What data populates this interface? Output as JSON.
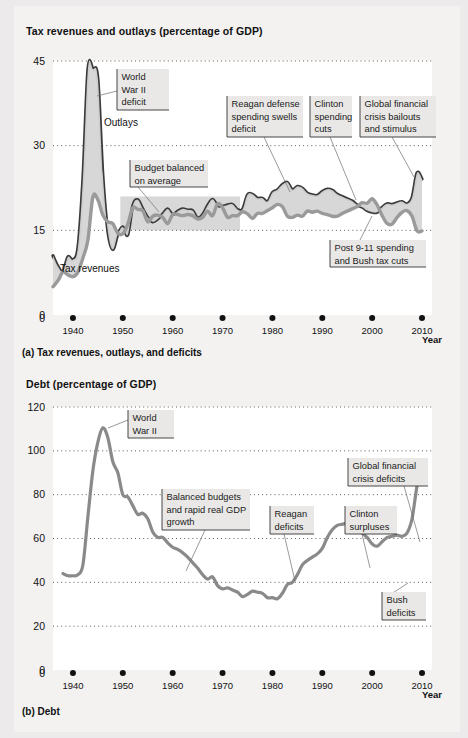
{
  "figure": {
    "background_color": "#eceaea",
    "paper_color": "#f3f2f1",
    "plot_background": "#ffffff"
  },
  "panel_a": {
    "axis_title": "Tax revenues and outlays (percentage of GDP)",
    "caption": "(a) Tax revenues, outlays, and deficits",
    "x_axis_title": "Year"
  },
  "panel_b": {
    "axis_title": "Debt (percentage of GDP)",
    "caption": "(b) Debt",
    "x_axis_title": "Year"
  },
  "chart_data": [
    {
      "type": "area",
      "id": "panel-a",
      "title": "Tax revenues and outlays (percentage of GDP)",
      "subtitle": "(a) Tax revenues, outlays, and deficits",
      "xlabel": "Year",
      "ylabel": "Tax revenues and outlays (percentage of GDP)",
      "xlim": [
        1936,
        2012
      ],
      "ylim": [
        0,
        45
      ],
      "yticks": [
        0,
        15,
        30,
        45
      ],
      "xticks": [
        1940,
        1950,
        1960,
        1970,
        1980,
        1990,
        2000,
        2010
      ],
      "grid": true,
      "legend_position": "inline-labels",
      "series": [
        {
          "name": "Outlays",
          "color": "#3a3a3a",
          "x": [
            1936,
            1937,
            1938,
            1939,
            1940,
            1941,
            1942,
            1943,
            1944,
            1945,
            1946,
            1947,
            1948,
            1949,
            1950,
            1951,
            1952,
            1953,
            1954,
            1955,
            1956,
            1957,
            1958,
            1959,
            1960,
            1961,
            1962,
            1963,
            1964,
            1965,
            1966,
            1967,
            1968,
            1969,
            1970,
            1971,
            1972,
            1973,
            1974,
            1975,
            1976,
            1977,
            1978,
            1979,
            1980,
            1981,
            1982,
            1983,
            1984,
            1985,
            1986,
            1987,
            1988,
            1989,
            1990,
            1991,
            1992,
            1993,
            1994,
            1995,
            1996,
            1997,
            1998,
            1999,
            2000,
            2001,
            2002,
            2003,
            2004,
            2005,
            2006,
            2007,
            2008,
            2009,
            2010
          ],
          "values": [
            10.5,
            8.6,
            7.7,
            10.3,
            9.8,
            12.0,
            24.3,
            43.6,
            43.6,
            41.9,
            24.8,
            14.8,
            11.6,
            14.3,
            15.6,
            14.2,
            19.4,
            20.4,
            18.8,
            17.3,
            16.5,
            17.0,
            17.9,
            18.8,
            17.8,
            18.4,
            18.8,
            18.6,
            18.5,
            17.2,
            17.8,
            19.4,
            20.5,
            19.4,
            19.3,
            19.5,
            19.6,
            18.7,
            18.7,
            21.3,
            21.4,
            20.7,
            20.7,
            20.1,
            21.7,
            22.2,
            23.1,
            23.5,
            22.2,
            22.8,
            22.5,
            21.6,
            21.3,
            21.2,
            21.9,
            22.3,
            22.1,
            21.4,
            21.0,
            20.6,
            20.2,
            19.5,
            19.1,
            18.5,
            18.2,
            18.2,
            19.1,
            19.7,
            19.6,
            19.9,
            20.1,
            19.7,
            20.8,
            25.2,
            24.1
          ]
        },
        {
          "name": "Tax revenues",
          "color": "#9a9a9a",
          "x": [
            1936,
            1937,
            1938,
            1939,
            1940,
            1941,
            1942,
            1943,
            1944,
            1945,
            1946,
            1947,
            1948,
            1949,
            1950,
            1951,
            1952,
            1953,
            1954,
            1955,
            1956,
            1957,
            1958,
            1959,
            1960,
            1961,
            1962,
            1963,
            1964,
            1965,
            1966,
            1967,
            1968,
            1969,
            1970,
            1971,
            1972,
            1973,
            1974,
            1975,
            1976,
            1977,
            1978,
            1979,
            1980,
            1981,
            1982,
            1983,
            1984,
            1985,
            1986,
            1987,
            1988,
            1989,
            1990,
            1991,
            1992,
            1993,
            1994,
            1995,
            1996,
            1997,
            1998,
            1999,
            2000,
            2001,
            2002,
            2003,
            2004,
            2005,
            2006,
            2007,
            2008,
            2009,
            2010
          ],
          "values": [
            5.0,
            6.1,
            7.6,
            7.1,
            6.8,
            7.6,
            10.1,
            13.3,
            20.9,
            20.4,
            17.7,
            16.5,
            16.2,
            14.5,
            14.4,
            16.1,
            19.0,
            18.7,
            18.5,
            16.5,
            17.5,
            17.7,
            17.3,
            16.2,
            17.8,
            17.8,
            17.6,
            17.8,
            17.6,
            17.0,
            17.3,
            18.4,
            17.6,
            19.7,
            19.0,
            17.3,
            17.6,
            17.6,
            18.3,
            17.9,
            17.1,
            18.0,
            18.0,
            18.5,
            19.0,
            19.6,
            19.2,
            17.5,
            17.3,
            17.7,
            17.5,
            18.4,
            18.2,
            18.4,
            18.0,
            17.8,
            17.5,
            17.5,
            18.0,
            18.4,
            18.8,
            19.2,
            19.9,
            19.8,
            20.6,
            19.5,
            17.6,
            16.2,
            16.1,
            17.3,
            18.2,
            18.5,
            17.5,
            14.9,
            14.9
          ]
        }
      ],
      "annotations": [
        {
          "text": [
            "World",
            "War II",
            "deficit"
          ],
          "box": {
            "x": 117,
            "y": 69,
            "w": 52,
            "h": 41
          },
          "leader": [
            [
              117,
              91
            ],
            [
              97,
              96
            ]
          ]
        },
        {
          "text": [
            "Budget balanced",
            "on average"
          ],
          "box": {
            "x": 130,
            "y": 160,
            "w": 78,
            "h": 27
          },
          "leader": [
            [
              138,
              187
            ],
            [
              159,
              212
            ]
          ]
        },
        {
          "text": [
            "Reagan defense",
            "spending swells",
            "deficit"
          ],
          "box": {
            "x": 227,
            "y": 96,
            "w": 76,
            "h": 41
          },
          "leader": [
            [
              264,
              137
            ],
            [
              290,
              192
            ]
          ]
        },
        {
          "text": [
            "Clinton",
            "spending",
            "cuts"
          ],
          "box": {
            "x": 310,
            "y": 96,
            "w": 42,
            "h": 41
          },
          "leader": [
            [
              330,
              137
            ],
            [
              356,
              200
            ]
          ]
        },
        {
          "text": [
            "Global financial",
            "crisis bailouts",
            "and stimulus"
          ],
          "box": {
            "x": 360,
            "y": 96,
            "w": 76,
            "h": 41
          },
          "leader": [
            [
              392,
              137
            ],
            [
              414,
              177
            ]
          ]
        },
        {
          "text": [
            "Post 9-11 spending",
            "and Bush tax cuts"
          ],
          "box": {
            "x": 330,
            "y": 240,
            "w": 96,
            "h": 27
          },
          "leader": [
            [
              360,
              240
            ],
            [
              372,
              216
            ]
          ]
        }
      ],
      "series_labels": [
        {
          "text": "Outlays",
          "x": 104,
          "y": 126
        },
        {
          "text": "Tax revenues",
          "x": 60,
          "y": 272
        }
      ],
      "shaded_box": {
        "x0": 1949.5,
        "x1": 1973.5,
        "y0": 15.0,
        "y1": 21.0,
        "color": "#d8d8d8"
      }
    },
    {
      "type": "line",
      "id": "panel-b",
      "title": "Debt (percentage of GDP)",
      "subtitle": "(b) Debt",
      "xlabel": "Year",
      "ylabel": "Debt (percentage of GDP)",
      "xlim": [
        1936,
        2012
      ],
      "ylim": [
        0,
        120
      ],
      "yticks": [
        0,
        20,
        40,
        60,
        80,
        100,
        120
      ],
      "xticks": [
        1940,
        1950,
        1960,
        1970,
        1980,
        1990,
        2000,
        2010
      ],
      "grid": true,
      "series": [
        {
          "name": "Debt",
          "color": "#8a8a8a",
          "x": [
            1938,
            1939,
            1940,
            1941,
            1942,
            1943,
            1944,
            1945,
            1946,
            1947,
            1948,
            1949,
            1950,
            1951,
            1952,
            1953,
            1954,
            1955,
            1956,
            1957,
            1958,
            1959,
            1960,
            1961,
            1962,
            1963,
            1964,
            1965,
            1966,
            1967,
            1968,
            1969,
            1970,
            1971,
            1972,
            1973,
            1974,
            1975,
            1976,
            1977,
            1978,
            1979,
            1980,
            1981,
            1982,
            1983,
            1984,
            1985,
            1986,
            1987,
            1988,
            1989,
            1990,
            1991,
            1992,
            1993,
            1994,
            1995,
            1996,
            1997,
            1998,
            1999,
            2000,
            2001,
            2002,
            2003,
            2004,
            2005,
            2006,
            2007,
            2008,
            2009,
            2010
          ],
          "values": [
            44.0,
            43.0,
            43.0,
            43.5,
            48.0,
            70.0,
            91.0,
            104.0,
            110.5,
            106.0,
            95.0,
            90.0,
            80.0,
            79.0,
            75.0,
            71.0,
            71.5,
            69.0,
            63.0,
            60.5,
            60.5,
            58.0,
            56.0,
            55.0,
            53.5,
            51.5,
            49.0,
            46.5,
            43.5,
            41.5,
            42.5,
            38.5,
            37.0,
            37.5,
            36.5,
            35.5,
            33.5,
            34.5,
            36.0,
            35.5,
            35.0,
            33.0,
            33.0,
            32.5,
            35.0,
            39.0,
            40.0,
            43.5,
            48.0,
            50.0,
            51.5,
            53.0,
            55.5,
            60.5,
            64.0,
            66.0,
            66.5,
            67.0,
            67.0,
            65.0,
            62.5,
            60.5,
            57.5,
            56.5,
            58.5,
            60.5,
            61.0,
            61.5,
            61.0,
            62.5,
            69.0,
            84.0,
            93.0
          ],
          "note": "Values are drawn to the visual curve of the figure (gross debt scaled to the plotted trace)."
        }
      ],
      "annotations": [
        {
          "text": [
            "World",
            "War II"
          ],
          "box": {
            "x": 128,
            "y": 410,
            "w": 46,
            "h": 28
          },
          "leader": [
            [
              128,
              420
            ],
            [
              108,
              428
            ]
          ]
        },
        {
          "text": [
            "Balanced budgets",
            "and rapid real GDP",
            "growth"
          ],
          "box": {
            "x": 162,
            "y": 489,
            "w": 88,
            "h": 41
          },
          "leader": [
            [
              205,
              530
            ],
            [
              186,
              571
            ]
          ]
        },
        {
          "text": [
            "Reagan",
            "deficits"
          ],
          "box": {
            "x": 270,
            "y": 506,
            "w": 44,
            "h": 28
          },
          "leader": [
            [
              284,
              534
            ],
            [
              295,
              581
            ]
          ]
        },
        {
          "text": [
            "Clinton",
            "surpluses"
          ],
          "box": {
            "x": 345,
            "y": 506,
            "w": 52,
            "h": 28
          },
          "leader": [
            [
              362,
              534
            ],
            [
              370,
              568
            ]
          ]
        },
        {
          "text": [
            "Global financial",
            "crisis deficits"
          ],
          "box": {
            "x": 348,
            "y": 458,
            "w": 80,
            "h": 28
          },
          "leader": [
            [
              404,
              486
            ],
            [
              420,
              542
            ]
          ]
        },
        {
          "text": [
            "Bush",
            "deficits"
          ],
          "box": {
            "x": 382,
            "y": 592,
            "w": 44,
            "h": 28
          },
          "leader": [
            [
              382,
              600
            ],
            [
              408,
              583
            ]
          ]
        }
      ]
    }
  ]
}
